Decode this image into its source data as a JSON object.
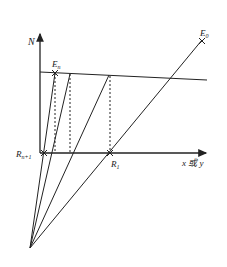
{
  "diagram": {
    "axes": {
      "y_label": "N",
      "x_label": "x 或 y"
    },
    "points": {
      "E_n": {
        "label": "E",
        "sub": "n"
      },
      "E_0": {
        "label": "E",
        "sub": "0"
      },
      "R_n1": {
        "label": "R",
        "sub": "n+1"
      },
      "R_1": {
        "label": "R",
        "sub": "1"
      }
    },
    "colors": {
      "line": "#222222"
    }
  }
}
